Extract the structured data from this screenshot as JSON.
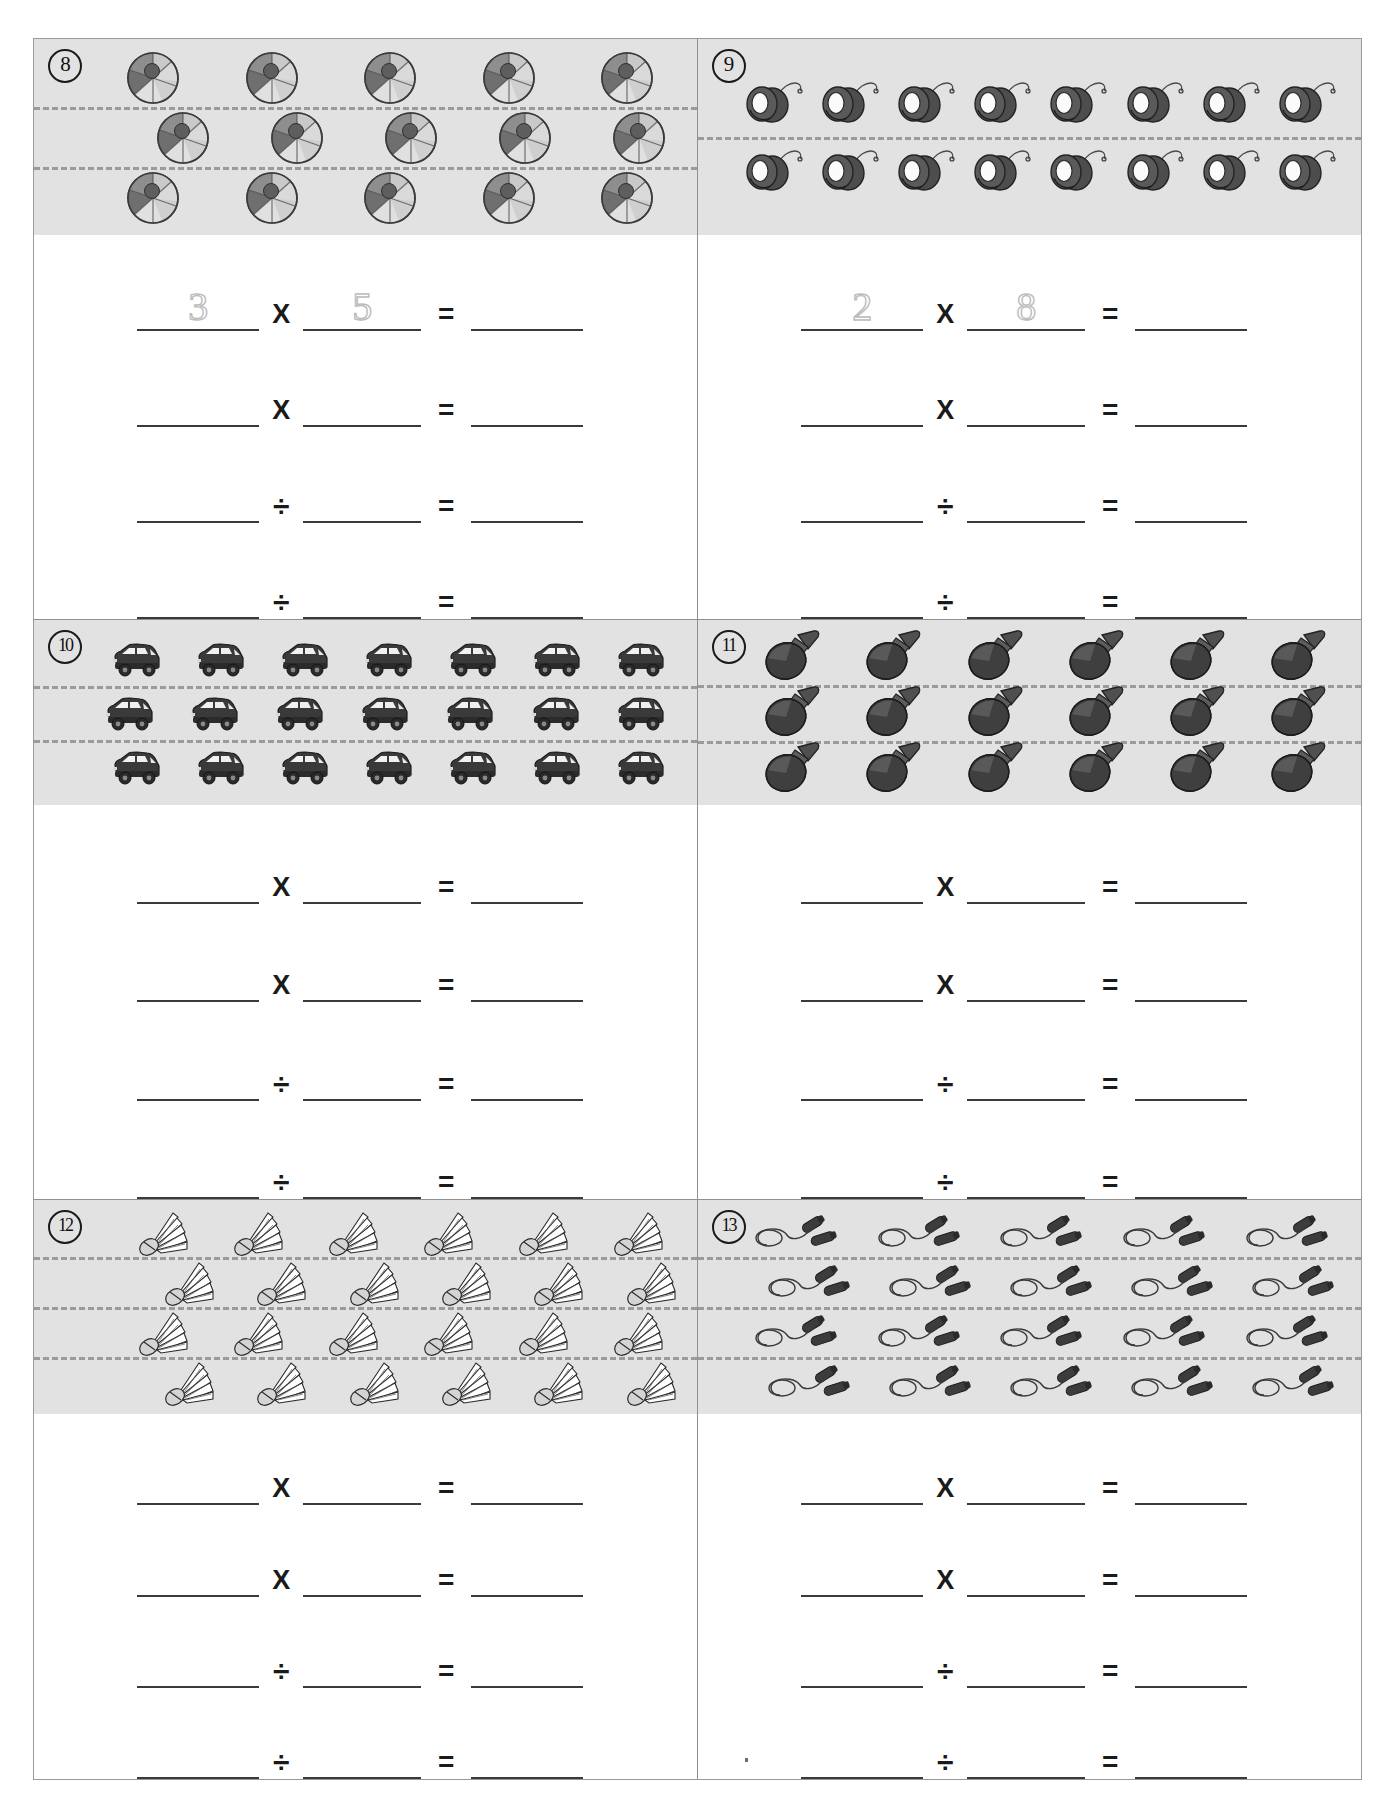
{
  "worksheet": {
    "type": "multiplication-division-array-worksheet",
    "background": "#ffffff",
    "band_color": "#e2e2e2",
    "line_color": "#3a3a3a",
    "problems": [
      {
        "number": "8",
        "object": "beach-ball",
        "rows": 3,
        "per_row": 5,
        "total": 15,
        "equations": [
          {
            "op": "X",
            "a": "3",
            "b": "5",
            "c": "",
            "a_hint": true,
            "b_hint": true
          },
          {
            "op": "X",
            "a": "",
            "b": "",
            "c": ""
          },
          {
            "op": "÷",
            "a": "",
            "b": "",
            "c": ""
          },
          {
            "op": "÷",
            "a": "",
            "b": "",
            "c": ""
          }
        ]
      },
      {
        "number": "9",
        "object": "yo-yo",
        "rows": 2,
        "per_row": 8,
        "total": 16,
        "equations": [
          {
            "op": "X",
            "a": "2",
            "b": "8",
            "c": "",
            "a_hint": true,
            "b_hint": true
          },
          {
            "op": "X",
            "a": "",
            "b": "",
            "c": ""
          },
          {
            "op": "÷",
            "a": "",
            "b": "",
            "c": ""
          },
          {
            "op": "÷",
            "a": "",
            "b": "",
            "c": ""
          }
        ]
      },
      {
        "number": "10",
        "object": "car",
        "rows": 3,
        "per_row": 7,
        "total": 21,
        "equations": [
          {
            "op": "X",
            "a": "",
            "b": "",
            "c": ""
          },
          {
            "op": "X",
            "a": "",
            "b": "",
            "c": ""
          },
          {
            "op": "÷",
            "a": "",
            "b": "",
            "c": ""
          },
          {
            "op": "÷",
            "a": "",
            "b": "",
            "c": ""
          }
        ]
      },
      {
        "number": "11",
        "object": "ping-pong-paddle",
        "rows": 3,
        "per_row": 6,
        "total": 18,
        "equations": [
          {
            "op": "X",
            "a": "",
            "b": "",
            "c": ""
          },
          {
            "op": "X",
            "a": "",
            "b": "",
            "c": ""
          },
          {
            "op": "÷",
            "a": "",
            "b": "",
            "c": ""
          },
          {
            "op": "÷",
            "a": "",
            "b": "",
            "c": ""
          }
        ]
      },
      {
        "number": "12",
        "object": "shuttlecock",
        "rows": 4,
        "per_row": 6,
        "total": 24,
        "equations": [
          {
            "op": "X",
            "a": "",
            "b": "",
            "c": ""
          },
          {
            "op": "X",
            "a": "",
            "b": "",
            "c": ""
          },
          {
            "op": "÷",
            "a": "",
            "b": "",
            "c": ""
          },
          {
            "op": "÷",
            "a": "",
            "b": "",
            "c": ""
          }
        ]
      },
      {
        "number": "13",
        "object": "jump-rope",
        "rows": 4,
        "per_row": 5,
        "total": 20,
        "equations": [
          {
            "op": "X",
            "a": "",
            "b": "",
            "c": ""
          },
          {
            "op": "X",
            "a": "",
            "b": "",
            "c": ""
          },
          {
            "op": "÷",
            "a": "",
            "b": "",
            "c": ""
          },
          {
            "op": "÷",
            "a": "",
            "b": "",
            "c": ""
          }
        ]
      }
    ]
  }
}
